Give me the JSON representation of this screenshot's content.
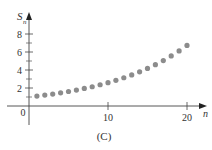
{
  "chart_data": {
    "type": "scatter",
    "title": "",
    "caption": "(C)",
    "xlabel": "n",
    "ylabel": "S",
    "ylabel_subscript": "n",
    "xlim": [
      0,
      21
    ],
    "ylim": [
      0,
      9
    ],
    "grid": false,
    "legend": "none",
    "x_ticks": [
      {
        "value": 10,
        "label": "10"
      },
      {
        "value": 20,
        "label": "20"
      }
    ],
    "y_ticks": [
      {
        "value": 2,
        "label": "2"
      },
      {
        "value": 4,
        "label": "4"
      },
      {
        "value": 6,
        "label": "6"
      },
      {
        "value": 8,
        "label": "8"
      }
    ],
    "y_minor_ticks": [
      1,
      3,
      5,
      7
    ],
    "origin_label": "0",
    "point_color": "#8c8c8c",
    "series": [
      {
        "name": "S_n",
        "x": [
          1,
          2,
          3,
          4,
          5,
          6,
          7,
          8,
          9,
          10,
          11,
          12,
          13,
          14,
          15,
          16,
          17,
          18,
          19,
          20
        ],
        "values": [
          1.1,
          1.21,
          1.33,
          1.46,
          1.61,
          1.77,
          1.95,
          2.14,
          2.36,
          2.59,
          2.85,
          3.14,
          3.45,
          3.8,
          4.18,
          4.59,
          5.05,
          5.56,
          6.12,
          6.73
        ]
      }
    ]
  }
}
